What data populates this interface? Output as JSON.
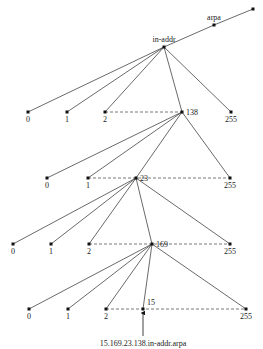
{
  "nodes": {
    "root": {
      "x": 253,
      "y": 9,
      "label": ""
    },
    "arpa": {
      "x": 214,
      "y": 25,
      "label": "arpa"
    },
    "in_addr": {
      "x": 164,
      "y": 47,
      "label": "in-addr"
    },
    "l1": [
      {
        "x": 28,
        "y": 112,
        "label": "0"
      },
      {
        "x": 67,
        "y": 112,
        "label": "1"
      },
      {
        "x": 105,
        "y": 112,
        "label": "2"
      },
      {
        "x": 182,
        "y": 112,
        "label": "138"
      },
      {
        "x": 231,
        "y": 112,
        "label": "255"
      }
    ],
    "l2": [
      {
        "x": 47,
        "y": 178,
        "label": "0"
      },
      {
        "x": 88,
        "y": 178,
        "label": "1"
      },
      {
        "x": 136,
        "y": 178,
        "label": "23"
      },
      {
        "x": 230,
        "y": 178,
        "label": "255"
      }
    ],
    "l3": [
      {
        "x": 13,
        "y": 244,
        "label": "0"
      },
      {
        "x": 51,
        "y": 244,
        "label": "1"
      },
      {
        "x": 89,
        "y": 244,
        "label": "2"
      },
      {
        "x": 152,
        "y": 244,
        "label": "169"
      },
      {
        "x": 230,
        "y": 244,
        "label": "255"
      }
    ],
    "l4": [
      {
        "x": 29,
        "y": 309,
        "label": "0"
      },
      {
        "x": 68,
        "y": 309,
        "label": "1"
      },
      {
        "x": 106,
        "y": 309,
        "label": "2"
      },
      {
        "x": 143,
        "y": 309,
        "label": "15"
      },
      {
        "x": 246,
        "y": 309,
        "label": "255"
      }
    ]
  },
  "result_label": "15.169.23.138.in-addr.arpa"
}
